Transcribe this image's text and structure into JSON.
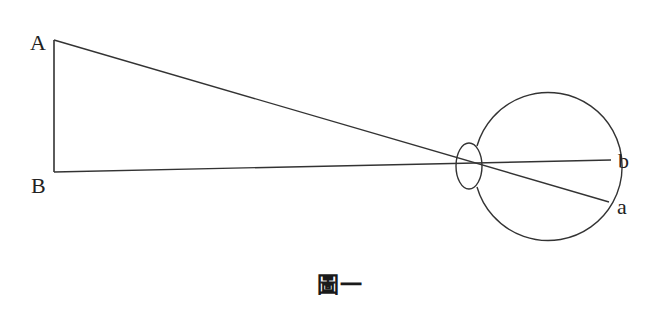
{
  "diagram": {
    "caption": "圖一",
    "colors": {
      "stroke": "#333333",
      "text": "#222222",
      "background": "#ffffff"
    },
    "points": {
      "A": {
        "label": "A",
        "x": 54,
        "y": 40
      },
      "B": {
        "label": "B",
        "x": 54,
        "y": 172
      },
      "a": {
        "label": "a",
        "x": 609,
        "y": 202
      },
      "b": {
        "label": "b",
        "x": 611,
        "y": 160
      }
    },
    "object_line": {
      "from": "A",
      "to": "B",
      "description": "vertical object AB"
    },
    "rays": [
      {
        "from": "A",
        "to": "a",
        "through": "lens"
      },
      {
        "from": "B",
        "to": "b",
        "through": "lens"
      }
    ],
    "lens": {
      "cx": 469,
      "cy": 163,
      "rx": 13,
      "ry": 23
    },
    "eyeball": {
      "cx": 540,
      "cy": 185,
      "r": 74
    }
  }
}
